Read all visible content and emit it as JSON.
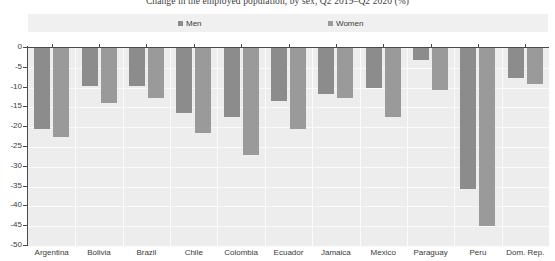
{
  "chart_data": {
    "type": "bar",
    "title": "Change in the employed population, by sex, Q2 2019–Q2 2020 (%)",
    "xlabel": "",
    "ylabel": "",
    "ylim": [
      -50,
      0
    ],
    "ytick_step": 5,
    "grid": true,
    "legend_position": "top",
    "categories": [
      "Argentina",
      "Bolivia",
      "Brazil",
      "Chile",
      "Colombia",
      "Ecuador",
      "Jamaica",
      "Mexico",
      "Paraguay",
      "Peru",
      "Dom. Rep."
    ],
    "yticks": [
      "0",
      "-5",
      "-10",
      "-15",
      "-20",
      "-25",
      "-30",
      "-35",
      "-40",
      "-45",
      "-50"
    ],
    "ytick_values": [
      0,
      -5,
      -10,
      -15,
      -20,
      -25,
      -30,
      -35,
      -40,
      -45,
      -50
    ],
    "series": [
      {
        "name": "Men",
        "color": "#8c8c8c",
        "values": [
          -20.5,
          -9.5,
          -9.5,
          -16.5,
          -17.5,
          -13.5,
          -11.5,
          -10.0,
          -3.0,
          -35.5,
          -7.5
        ]
      },
      {
        "name": "Women",
        "color": "#9a9a9a",
        "values": [
          -22.5,
          -14.0,
          -12.5,
          -21.5,
          -27.0,
          -20.5,
          -12.5,
          -17.5,
          -10.5,
          -45.0,
          -9.0
        ]
      }
    ]
  },
  "style": {
    "plot_background": "#ededed",
    "legend_background": "#f0f0f0",
    "gridline_color": "#fbfbfb",
    "axis_color": "#4a4a4a",
    "text_color": "#3a3a3a"
  }
}
